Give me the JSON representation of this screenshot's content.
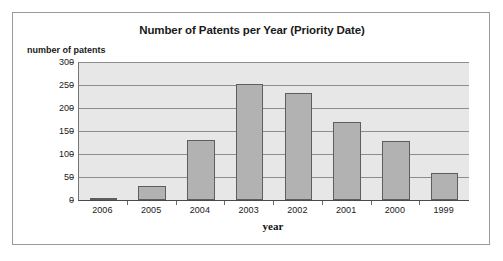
{
  "figure": {
    "title": "Number of Patents per Year (Priority Date)",
    "y_axis_title": "number of patents",
    "x_axis_title": "year"
  },
  "colors": {
    "bar_fill": "#b2b2b2",
    "bar_border": "#5e5e5e",
    "plot_background": "#e7e7e7",
    "gridline": "#8d8d8d",
    "frame_border": "#9a9a9a",
    "text": "#1a1a1a"
  },
  "chart_data": {
    "type": "bar",
    "title": "Number of Patents per Year (Priority Date)",
    "xlabel": "year",
    "ylabel": "number of patents",
    "categories": [
      "2006",
      "2005",
      "2004",
      "2003",
      "2002",
      "2001",
      "2000",
      "1999"
    ],
    "values": [
      2,
      30,
      131,
      253,
      233,
      170,
      128,
      58
    ],
    "ylim": [
      0,
      300
    ],
    "yticks": [
      0,
      50,
      100,
      150,
      200,
      250,
      300
    ],
    "ytick_labels": [
      "0",
      "50",
      "100",
      "150",
      "200",
      "250",
      "300"
    ],
    "grid": true,
    "legend": false,
    "orientation": "vertical"
  }
}
